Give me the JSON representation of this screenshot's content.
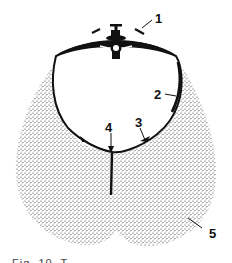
{
  "figure": {
    "type": "anatomical cross-section diagram",
    "labels": [
      {
        "id": "1",
        "text": "1"
      },
      {
        "id": "2",
        "text": "2"
      },
      {
        "id": "3",
        "text": "3"
      },
      {
        "id": "4",
        "text": "4"
      },
      {
        "id": "5",
        "text": "5"
      }
    ],
    "caption": "Fig. 10. T",
    "colors": {
      "ink": "#111111",
      "stipple": "#333333",
      "background": "#ffffff"
    }
  }
}
